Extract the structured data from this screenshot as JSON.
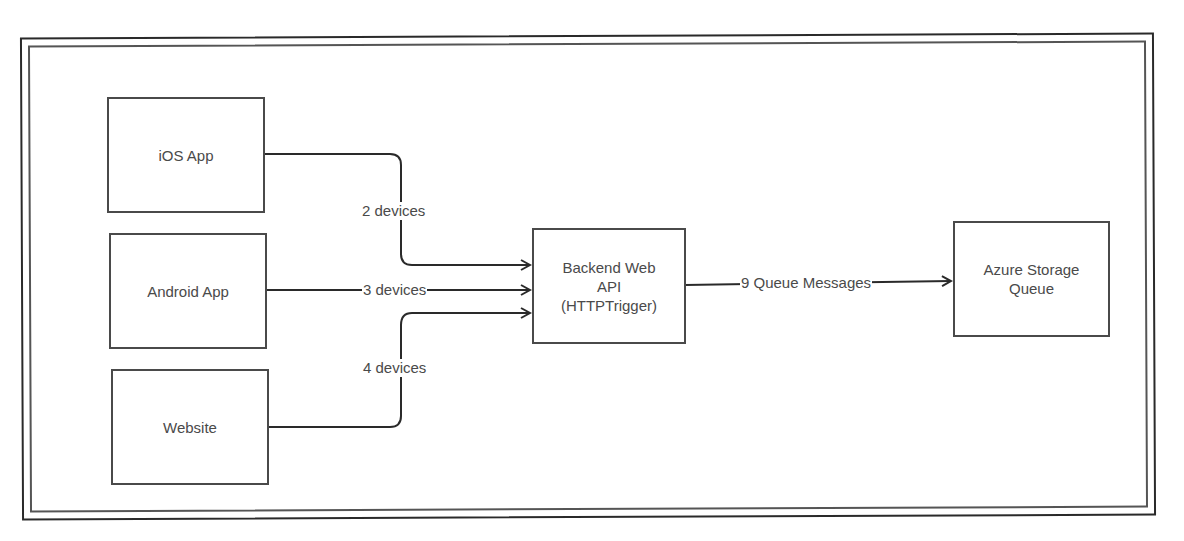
{
  "diagram": {
    "nodes": [
      {
        "id": "ios-app",
        "label": "iOS App"
      },
      {
        "id": "android-app",
        "label": "Android App"
      },
      {
        "id": "website",
        "label": "Website"
      },
      {
        "id": "backend-web-api",
        "label": "Backend Web\nAPI\n(HTTPTrigger)"
      },
      {
        "id": "azure-storage-queue",
        "label": "Azure Storage\nQueue"
      }
    ],
    "edges": [
      {
        "from": "ios-app",
        "to": "backend-web-api",
        "label": "2 devices"
      },
      {
        "from": "android-app",
        "to": "backend-web-api",
        "label": "3 devices"
      },
      {
        "from": "website",
        "to": "backend-web-api",
        "label": "4 devices"
      },
      {
        "from": "backend-web-api",
        "to": "azure-storage-queue",
        "label": "9 Queue Messages"
      }
    ],
    "colors": {
      "stroke": "#2a2a2a",
      "box_border": "#4a4a4a",
      "text": "#4a4a4a",
      "background": "#ffffff"
    }
  }
}
